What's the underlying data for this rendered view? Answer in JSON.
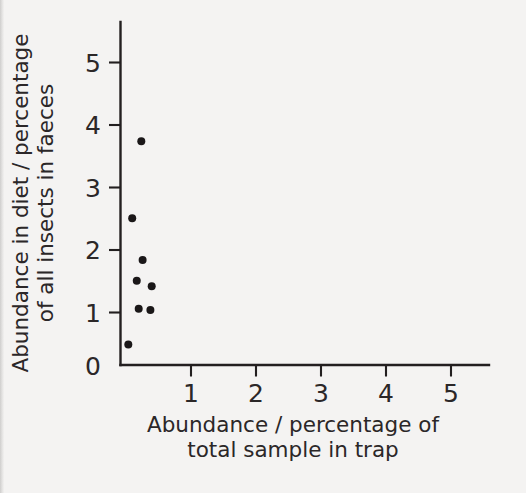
{
  "figure": {
    "background_color": "#f4f3f2",
    "ink_color": "#231f20"
  },
  "axes": {
    "x": {
      "title_line1": "Abundance / percentage of",
      "title_line2": "total sample in trap",
      "ticks": [
        "1",
        "2",
        "3",
        "4",
        "5"
      ],
      "range": [
        0,
        5.6
      ]
    },
    "y": {
      "title_line1": "Abundance in diet / percentage",
      "title_line2": "of all insects in faeces",
      "ticks": [
        "5",
        "4",
        "3",
        "2",
        "1",
        "0"
      ],
      "range": [
        0,
        5.5
      ]
    }
  },
  "chart_data": {
    "type": "scatter",
    "title": "",
    "xlabel": "Abundance / percentage of total sample in trap",
    "ylabel": "Abundance in diet / percentage of all insects in faeces",
    "xlim": [
      0,
      5.6
    ],
    "ylim": [
      0,
      5.5
    ],
    "xticks": [
      1,
      2,
      3,
      4,
      5
    ],
    "yticks": [
      0,
      1,
      2,
      3,
      4,
      5
    ],
    "grid": false,
    "legend": null,
    "marker": {
      "shape": "circle",
      "color": "#1a1718",
      "size_px": 8
    },
    "series": [
      {
        "name": "insect taxa",
        "points": [
          {
            "x": 0.32,
            "y": 3.58
          },
          {
            "x": 0.18,
            "y": 2.35
          },
          {
            "x": 0.34,
            "y": 1.68
          },
          {
            "x": 0.25,
            "y": 1.35
          },
          {
            "x": 0.48,
            "y": 1.26
          },
          {
            "x": 0.28,
            "y": 0.9
          },
          {
            "x": 0.46,
            "y": 0.88
          },
          {
            "x": 0.12,
            "y": 0.33
          }
        ]
      }
    ]
  }
}
